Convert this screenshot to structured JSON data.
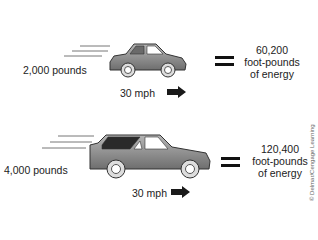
{
  "diagram": {
    "rows": [
      {
        "vehicle": "small-car",
        "weight": "2,000 pounds",
        "speed": "30 mph",
        "equals": "=",
        "energy_value": "60,200",
        "energy_unit": "foot-pounds",
        "energy_suffix": "of energy"
      },
      {
        "vehicle": "large-car",
        "weight": "4,000 pounds",
        "speed": "30 mph",
        "equals": "=",
        "energy_value": "120,400",
        "energy_unit": "foot-pounds",
        "energy_suffix": "of energy"
      }
    ],
    "credit": "© Delmar/Cengage Learning",
    "colors": {
      "car_body": "#8a8a8a",
      "window_dark": "#2a2a2a",
      "text": "#222222",
      "arrow": "#1a1a1a"
    }
  }
}
